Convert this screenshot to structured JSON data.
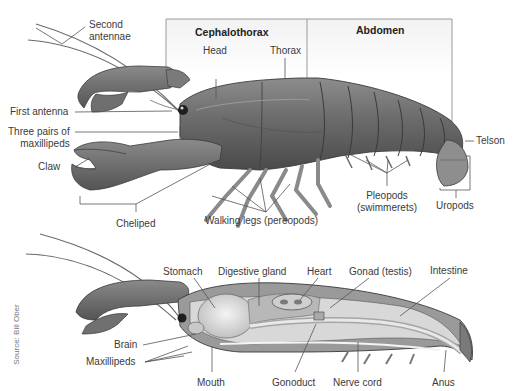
{
  "top_diagram": {
    "regions": {
      "cephalothorax": "Cephalothorax",
      "abdomen": "Abdomen"
    },
    "labels": {
      "second_antennae": [
        "Second",
        "antennae"
      ],
      "head": "Head",
      "thorax": "Thorax",
      "first_antenna": "First antenna",
      "maxillipeds": [
        "Three pairs of",
        "maxillipeds"
      ],
      "claw": "Claw",
      "cheliped": "Cheliped",
      "walking_legs": "Walking legs (pereopods)",
      "pleopods": [
        "Pleopods",
        "(swimmerets)"
      ],
      "telson": "Telson",
      "uropods": "Uropods"
    }
  },
  "bottom_diagram": {
    "labels": {
      "stomach": "Stomach",
      "digestive_gland": "Digestive gland",
      "heart": "Heart",
      "gonad": "Gonad (testis)",
      "intestine": "Intestine",
      "brain": "Brain",
      "maxillipeds": "Maxillipeds",
      "mouth": "Mouth",
      "gonoduct": "Gonoduct",
      "nerve_cord": "Nerve cord",
      "anus": "Anus"
    }
  },
  "credit": "Source: Bill Ober",
  "colors": {
    "body_dark": "#5a5a5a",
    "body_mid": "#8a8a8a",
    "body_light": "#c4c4c4",
    "leader_line": "#555555",
    "bracket_box": "#9a9a9a",
    "organ_light": "#e4e4e4"
  }
}
